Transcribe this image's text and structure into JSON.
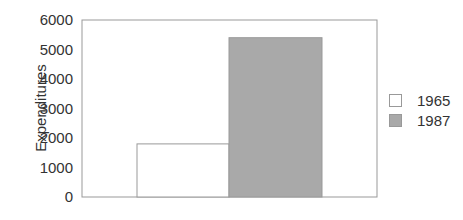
{
  "chart_data": {
    "type": "bar",
    "title": "",
    "xlabel": "",
    "ylabel": "Expenditures",
    "ylim": [
      0,
      6000
    ],
    "yticks": [
      0,
      1000,
      2000,
      3000,
      4000,
      5000,
      6000
    ],
    "grid": false,
    "legend_position": "right",
    "categories": [
      ""
    ],
    "series": [
      {
        "name": "1965",
        "values": [
          1800
        ],
        "color": "#ffffff"
      },
      {
        "name": "1987",
        "values": [
          5400
        ],
        "color": "#a9a9a9"
      }
    ]
  },
  "legend": {
    "items": [
      {
        "label": "1965",
        "color": "#ffffff"
      },
      {
        "label": "1987",
        "color": "#a9a9a9"
      }
    ]
  },
  "axis": {
    "ylabel": "Expenditures",
    "ticks": [
      "0",
      "1000",
      "2000",
      "3000",
      "4000",
      "5000",
      "6000"
    ]
  }
}
